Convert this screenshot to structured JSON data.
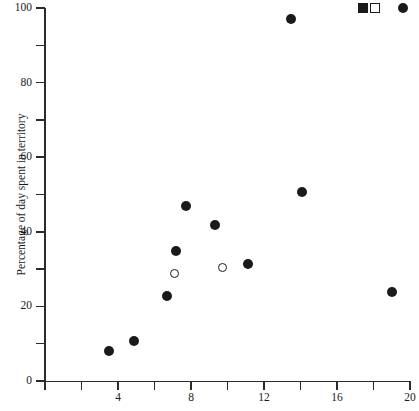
{
  "chart_data": {
    "type": "scatter",
    "title": "",
    "xlabel": "",
    "ylabel": "Percentage of day spent in territory",
    "xlim": [
      0,
      20
    ],
    "ylim": [
      0,
      100
    ],
    "grid": false,
    "legend_position": "top-right-inside",
    "x_ticks": [
      {
        "value": 0,
        "label": ""
      },
      {
        "value": 2,
        "label": ""
      },
      {
        "value": 4,
        "label": "4"
      },
      {
        "value": 6,
        "label": ""
      },
      {
        "value": 8,
        "label": "8"
      },
      {
        "value": 10,
        "label": ""
      },
      {
        "value": 12,
        "label": "12"
      },
      {
        "value": 14,
        "label": ""
      },
      {
        "value": 16,
        "label": "16"
      },
      {
        "value": 18,
        "label": ""
      },
      {
        "value": 20,
        "label": "20"
      }
    ],
    "y_ticks": [
      {
        "value": 0,
        "label": "0"
      },
      {
        "value": 10,
        "label": ""
      },
      {
        "value": 20,
        "label": "20"
      },
      {
        "value": 30,
        "label": ""
      },
      {
        "value": 40,
        "label": "40"
      },
      {
        "value": 50,
        "label": ""
      },
      {
        "value": 60,
        "label": "60"
      },
      {
        "value": 70,
        "label": ""
      },
      {
        "value": 80,
        "label": "80"
      },
      {
        "value": 90,
        "label": ""
      },
      {
        "value": 100,
        "label": "100"
      }
    ],
    "series": [
      {
        "name": "filled-circle",
        "marker": "filled-circle",
        "color": "#1a1a1a",
        "points": [
          {
            "x": 3.5,
            "y": 8
          },
          {
            "x": 4.9,
            "y": 10.8
          },
          {
            "x": 6.7,
            "y": 22.8
          },
          {
            "x": 7.2,
            "y": 34.8
          },
          {
            "x": 7.7,
            "y": 47
          },
          {
            "x": 9.3,
            "y": 41.8
          },
          {
            "x": 11.1,
            "y": 31.5
          },
          {
            "x": 13.5,
            "y": 97
          },
          {
            "x": 14.1,
            "y": 50.8
          },
          {
            "x": 19.0,
            "y": 23.8
          }
        ]
      },
      {
        "name": "open-circle",
        "marker": "open-circle",
        "color": "#1a1a1a",
        "points": [
          {
            "x": 7.1,
            "y": 28.8
          },
          {
            "x": 9.7,
            "y": 30.5
          }
        ]
      }
    ],
    "legend": [
      {
        "label": "",
        "marker": "filled-square",
        "x": 17.4,
        "y": 100
      },
      {
        "label": "",
        "marker": "open-square",
        "x": 18.1,
        "y": 100
      },
      {
        "label": "",
        "marker": "filled-circle",
        "x": 19.6,
        "y": 100
      }
    ]
  }
}
